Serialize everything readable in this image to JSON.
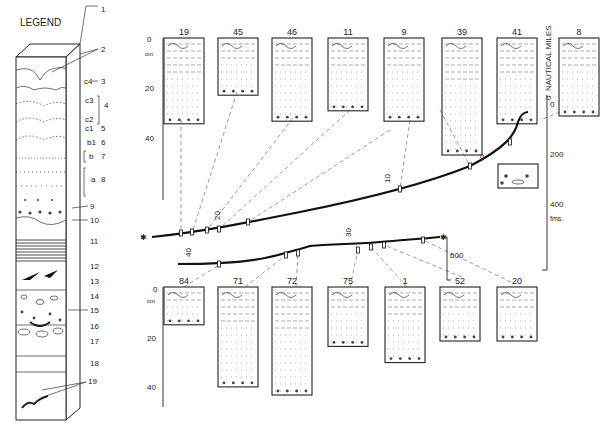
{
  "legend": {
    "title": "LEGEND",
    "items": [
      "1",
      "2",
      "3",
      "4",
      "5",
      "6",
      "7",
      "8",
      "9",
      "10",
      "11",
      "12",
      "13",
      "14",
      "15",
      "16",
      "17",
      "18",
      "19"
    ],
    "sub_labels": {
      "c4": "c4",
      "c3": "c3",
      "c2": "c2",
      "c1": "c1",
      "b1": "b1",
      "b": "b",
      "a": "a"
    }
  },
  "upper_cores": {
    "axis": {
      "unit": "cm",
      "ticks": [
        "0",
        "20",
        "40"
      ]
    },
    "cores": [
      {
        "id": "19",
        "depth_cm": 33
      },
      {
        "id": "45",
        "depth_cm": 22
      },
      {
        "id": "46",
        "depth_cm": 32
      },
      {
        "id": "11",
        "depth_cm": 28
      },
      {
        "id": "9",
        "depth_cm": 32
      },
      {
        "id": "39",
        "depth_cm": 45
      },
      {
        "id": "41",
        "depth_cm": 33
      },
      {
        "id": "8",
        "depth_cm": 30
      }
    ],
    "extra_core": {
      "id": "0"
    }
  },
  "lower_cores": {
    "axis": {
      "unit": "cm",
      "ticks": [
        "0",
        "20",
        "40"
      ]
    },
    "cores": [
      {
        "id": "84",
        "depth_cm": 14
      },
      {
        "id": "71",
        "depth_cm": 37
      },
      {
        "id": "72",
        "depth_cm": 40
      },
      {
        "id": "75",
        "depth_cm": 22
      },
      {
        "id": "1",
        "depth_cm": 28
      },
      {
        "id": "52",
        "depth_cm": 20
      },
      {
        "id": "20",
        "depth_cm": 20
      }
    ]
  },
  "depth_axis": {
    "title": "NAUTICAL MILES",
    "zero_label": "0",
    "ticks": [
      "0",
      "200",
      "400",
      "600"
    ],
    "unit": "fms."
  },
  "profile": {
    "distance_labels": [
      "10",
      "20",
      "30",
      "40"
    ]
  }
}
